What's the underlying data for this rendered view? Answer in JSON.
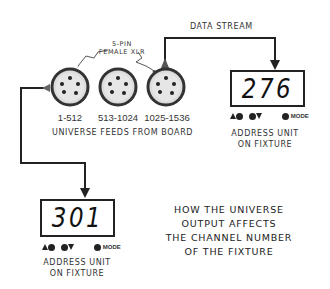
{
  "data_stream_label": "DATA STREAM",
  "connector_label": {
    "line1": "5-PIN",
    "line2": "FEMALE XLR"
  },
  "connectors": [
    {
      "range": "1-512"
    },
    {
      "range": "513-1024"
    },
    {
      "range": "1025-1536"
    }
  ],
  "connectors_caption": "UNIVERSE FEEDS FROM BOARD",
  "fixture_right": {
    "value": "276",
    "mode_label": "MODE",
    "caption_line1": "ADDRESS UNIT",
    "caption_line2": "ON FIXTURE"
  },
  "fixture_left": {
    "value": "301",
    "mode_label": "MODE",
    "caption_line1": "ADDRESS UNIT",
    "caption_line2": "ON FIXTURE"
  },
  "title": {
    "line1": "HOW THE UNIVERSE",
    "line2": "OUTPUT AFFECTS",
    "line3": "THE CHANNEL NUMBER",
    "line4": "OF THE FIXTURE"
  }
}
